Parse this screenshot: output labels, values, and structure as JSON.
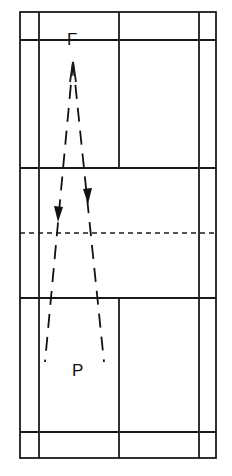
{
  "diagram": {
    "type": "badminton-court-shot-diagram",
    "colors": {
      "lines": "#1a1a1a",
      "background": "#ffffff"
    },
    "court": {
      "outer": {
        "x1": 20,
        "y1": 12,
        "x2": 216,
        "y2": 458
      },
      "singles_sidelines_x": [
        39,
        199
      ],
      "center_line_x": 119,
      "long_service_lines_y": [
        40,
        432
      ],
      "short_service_lines_y": [
        168,
        298
      ],
      "net_y": 233
    },
    "labels": {
      "top_player": "F",
      "bottom_player": "P"
    },
    "shot_paths": [
      {
        "name": "left-drop",
        "from": [
          73,
          62
        ],
        "to": [
          45,
          362
        ],
        "arrow_at": [
          58,
          222
        ]
      },
      {
        "name": "right-drop",
        "from": [
          73,
          62
        ],
        "to": [
          104,
          362
        ],
        "arrow_at": [
          88,
          204
        ]
      }
    ]
  }
}
